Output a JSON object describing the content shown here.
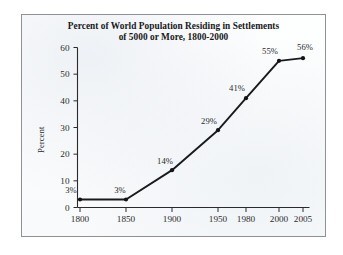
{
  "chart_data": {
    "type": "line",
    "title": "Percent of World Population Residing in Settlements of 5000 or More, 1800-2000",
    "title_line1": "Percent of World Population Residing in Settlements",
    "title_line2": "of 5000 or More, 1800-2000",
    "xlabel": "",
    "ylabel": "Percent",
    "categories": [
      "1800",
      "1850",
      "1900",
      "1950",
      "1980",
      "2000",
      "2005"
    ],
    "x": [
      1800,
      1850,
      1900,
      1950,
      1980,
      2000,
      2005
    ],
    "values": [
      3,
      3,
      14,
      29,
      41,
      55,
      56
    ],
    "point_labels": [
      "3%",
      "3%",
      "14%",
      "29%",
      "41%",
      "55%",
      "56%"
    ],
    "ylim": [
      0,
      60
    ],
    "y_ticks": [
      "0",
      "10",
      "20",
      "30",
      "40",
      "50",
      "60"
    ],
    "y_tick_values": [
      0,
      10,
      20,
      30,
      40,
      50,
      60
    ],
    "x_ticks": [
      "1800",
      "1850",
      "1900",
      "1950",
      "1980",
      "2000",
      "2005"
    ],
    "grid": false,
    "legend": false,
    "series": [
      {
        "name": "Percent of world population in settlements of 5000 or more",
        "values": [
          3,
          3,
          14,
          29,
          41,
          55,
          56
        ]
      }
    ],
    "colors": {
      "line": "#1a1a1c",
      "marker": "#141416",
      "axis": "#2a2a2c",
      "frame": "#8f9196",
      "background": "#fbfcfd",
      "text": "#18181a"
    }
  }
}
